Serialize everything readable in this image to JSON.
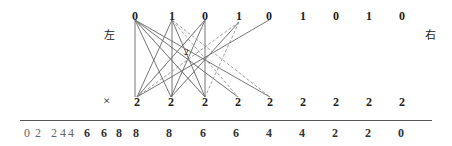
{
  "diagram": {
    "left_label": "左",
    "right_label": "右",
    "multiply_symbol": "×",
    "top_row": [
      {
        "value": "0",
        "x": 135
      },
      {
        "value": "1",
        "x": 172
      },
      {
        "value": "0",
        "x": 205
      },
      {
        "value": "1",
        "x": 239
      },
      {
        "value": "0",
        "x": 269
      },
      {
        "value": "1",
        "x": 303
      },
      {
        "value": "0",
        "x": 336
      },
      {
        "value": "1",
        "x": 369
      },
      {
        "value": "0",
        "x": 402
      }
    ],
    "bottom_row": [
      {
        "value": "2",
        "x": 137
      },
      {
        "value": "2",
        "x": 171
      },
      {
        "value": "2",
        "x": 205
      },
      {
        "value": "2",
        "x": 238
      },
      {
        "value": "2",
        "x": 270
      },
      {
        "value": "2",
        "x": 303
      },
      {
        "value": "2",
        "x": 336
      },
      {
        "value": "2",
        "x": 369
      },
      {
        "value": "2",
        "x": 402
      }
    ],
    "result_row": [
      {
        "value": "0",
        "x": 27,
        "light": true
      },
      {
        "value": "2",
        "x": 38,
        "light": true
      },
      {
        "value": "2",
        "x": 54,
        "light": true
      },
      {
        "value": "4",
        "x": 63,
        "light": true
      },
      {
        "value": "4",
        "x": 71,
        "light": true
      },
      {
        "value": "6",
        "x": 87
      },
      {
        "value": "6",
        "x": 104
      },
      {
        "value": "8",
        "x": 119
      },
      {
        "value": "8",
        "x": 136
      },
      {
        "value": "8",
        "x": 169
      },
      {
        "value": "6",
        "x": 203
      },
      {
        "value": "6",
        "x": 236
      },
      {
        "value": "4",
        "x": 269
      },
      {
        "value": "4",
        "x": 302
      },
      {
        "value": "2",
        "x": 335
      },
      {
        "value": "2",
        "x": 368
      },
      {
        "value": "0",
        "x": 401
      }
    ],
    "hub_label": "2",
    "colors": {
      "solid_line": "#666666",
      "dashed_line": "#888888",
      "text": "#222222"
    }
  }
}
